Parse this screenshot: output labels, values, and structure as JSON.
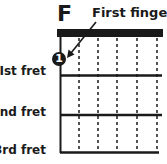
{
  "chord": {
    "name": "F",
    "annotation": "First finger"
  },
  "fret_labels": [
    "Ist fret",
    "2nd fret",
    "3rd fret"
  ],
  "finger": {
    "number": "1",
    "fret": 1,
    "string": "low-E (leftmost)"
  },
  "colors": {
    "ink": "#1a1a1a",
    "background": "#ffffff"
  }
}
